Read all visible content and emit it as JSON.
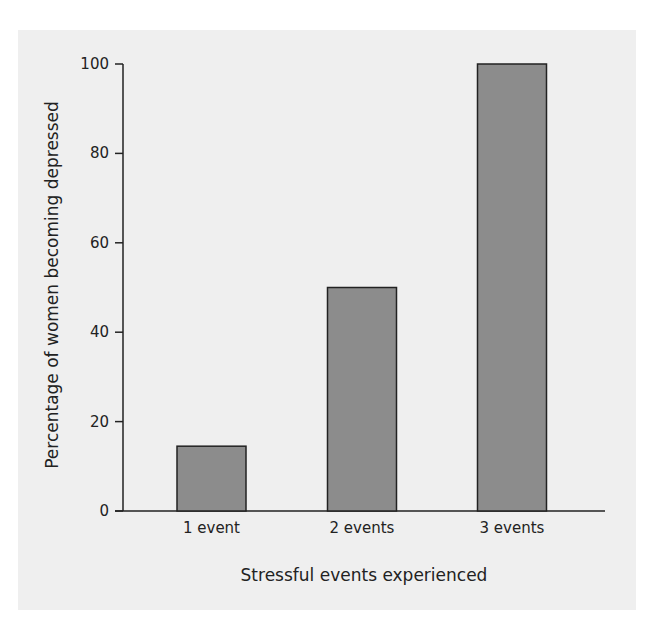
{
  "chart_data": {
    "type": "bar",
    "title": "",
    "xlabel": "Stressful events experienced",
    "ylabel": "Percentage of women becoming depressed",
    "categories": [
      "1 event",
      "2 events",
      "3 events"
    ],
    "values": [
      14.5,
      50,
      100
    ],
    "ylim": [
      0,
      100
    ],
    "yticks": [
      0,
      20,
      40,
      60,
      80,
      100
    ],
    "grid": false,
    "legend": null,
    "bar_color": "#8c8c8c",
    "bar_edge_color": "#222222",
    "background_color": "#efefef"
  }
}
